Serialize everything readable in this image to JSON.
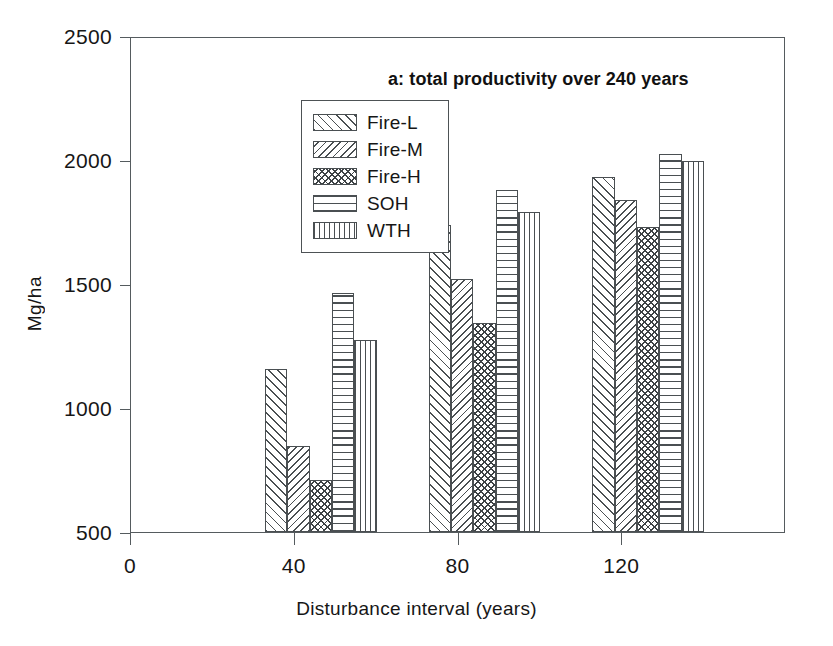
{
  "chart_data": {
    "type": "bar",
    "title": "a: total productivity over 240 years",
    "xlabel": "Disturbance interval (years)",
    "ylabel": "Mg/ha",
    "categories": [
      "40",
      "80",
      "120"
    ],
    "xlim": [
      0,
      160
    ],
    "ylim": [
      500,
      2500
    ],
    "xticks": [
      "0",
      "40",
      "80",
      "120"
    ],
    "yticks": [
      "500",
      "1000",
      "1500",
      "2000",
      "2500"
    ],
    "grid": false,
    "legend_position": "upper-left-inside",
    "series": [
      {
        "name": "Fire-L",
        "pattern": "diagonal-forward-hatch",
        "values": [
          1157,
          1738,
          1931
        ]
      },
      {
        "name": "Fire-M",
        "pattern": "diagonal-backward-hatch",
        "values": [
          845,
          1520,
          1839
        ]
      },
      {
        "name": "Fire-H",
        "pattern": "cross-hatch",
        "values": [
          710,
          1343,
          1730
        ]
      },
      {
        "name": "SOH",
        "pattern": "horizontal-lines",
        "values": [
          1462,
          1879,
          2024
        ]
      },
      {
        "name": "WTH",
        "pattern": "vertical-lines",
        "values": [
          1274,
          1790,
          1996
        ]
      }
    ]
  },
  "colors": {
    "axis": "#555b5e",
    "bar_outline": "#4a4f52",
    "hatch": "#4a4f52",
    "background": "#ffffff",
    "text": "#161616"
  }
}
